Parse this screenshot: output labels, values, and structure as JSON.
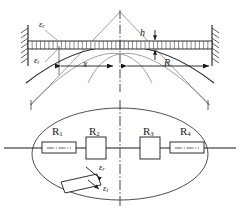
{
  "figure": {
    "width": 240,
    "height": 210,
    "background": "#ffffff",
    "line_color": "#1a1a1a",
    "text_color": "#1a1a1a"
  },
  "upper_view": {
    "name": "cross-section-elevation",
    "description": "Deflected clamped beam / diaphragm section between two fixed supports",
    "labels": {
      "strain_top": "ε",
      "strain_top_sub": "r",
      "strain_bottom": "ε",
      "strain_bottom_sub": "t",
      "thickness": "h",
      "distance_x": "x",
      "radius_R": "R"
    },
    "supports": {
      "left_label": "fixed-support-left",
      "right_label": "fixed-support-right",
      "hatch_count": 7
    },
    "beam": {
      "tick_count": 44,
      "note": "hatched beam band"
    }
  },
  "lower_view": {
    "name": "plan-view-ellipse",
    "description": "Plan view of circular diaphragm showing four strain gauges on the diameter axis",
    "gauges": [
      {
        "label": "R",
        "sub": "1",
        "orientation": "radial-wide",
        "position": "left-outer"
      },
      {
        "label": "R",
        "sub": "2",
        "orientation": "tangential-tall",
        "position": "left-inner"
      },
      {
        "label": "R",
        "sub": "3",
        "orientation": "tangential-tall",
        "position": "right-inner"
      },
      {
        "label": "R",
        "sub": "4",
        "orientation": "radial-wide",
        "position": "right-outer"
      }
    ],
    "callout": {
      "name": "inclined-gauge-callout",
      "strain_radial": "ε",
      "strain_radial_sub": "r",
      "strain_tangential": "ε",
      "strain_tangential_sub": "t"
    }
  }
}
